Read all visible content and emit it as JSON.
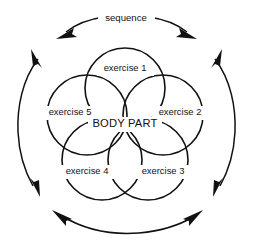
{
  "diagram": {
    "type": "venn-cycle",
    "title_label": "sequence",
    "center_label": "BODY PART",
    "stroke_color": "#111111",
    "background_color": "#ffffff",
    "nodes": [
      {
        "id": "exercise-1",
        "label": "exercise 1",
        "position": "top",
        "cx": 125,
        "cy": 88,
        "r": 40,
        "label_x": 125,
        "label_y": 69
      },
      {
        "id": "exercise-2",
        "label": "exercise 2",
        "position": "right",
        "cx": 163,
        "cy": 115,
        "r": 40,
        "label_x": 180,
        "label_y": 113
      },
      {
        "id": "exercise-3",
        "label": "exercise 3",
        "position": "bottom-right",
        "cx": 148,
        "cy": 160,
        "r": 40,
        "label_x": 163,
        "label_y": 172
      },
      {
        "id": "exercise-4",
        "label": "exercise 4",
        "position": "bottom-left",
        "cx": 102,
        "cy": 160,
        "r": 40,
        "label_x": 87,
        "label_y": 172
      },
      {
        "id": "exercise-5",
        "label": "exercise 5",
        "position": "left",
        "cx": 87,
        "cy": 115,
        "r": 40,
        "label_x": 70,
        "label_y": 113
      }
    ],
    "center_label_x": 125,
    "center_label_y": 124,
    "sequence_label_x": 126,
    "sequence_label_y": 18,
    "cycle_arrows": [
      {
        "id": "arc-top",
        "side": "top",
        "double_headed": true,
        "label": "sequence"
      },
      {
        "id": "arc-right",
        "side": "right",
        "double_headed": true,
        "label": ""
      },
      {
        "id": "arc-bottom",
        "side": "bottom",
        "double_headed": true,
        "label": ""
      },
      {
        "id": "arc-left",
        "side": "left",
        "double_headed": true,
        "label": ""
      }
    ]
  }
}
